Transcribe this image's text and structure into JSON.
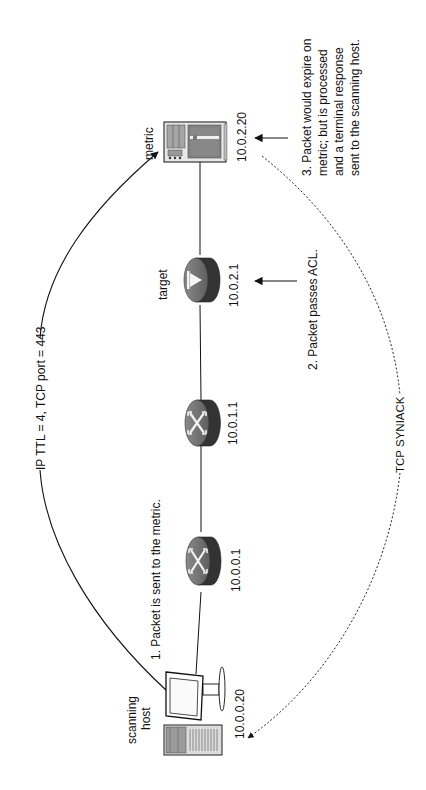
{
  "diagram": {
    "orientation": "rotated-90-ccw",
    "nodes": [
      {
        "id": "scanning-host",
        "label_line1": "scanning",
        "label_line2": "host",
        "ip": "10.0.0.20",
        "type": "workstation"
      },
      {
        "id": "router-1",
        "ip": "10.0.0.1",
        "type": "router"
      },
      {
        "id": "router-2",
        "ip": "10.0.1.1",
        "type": "router"
      },
      {
        "id": "target",
        "label": "target",
        "ip": "10.0.2.1",
        "type": "firewall-router"
      },
      {
        "id": "metric",
        "label": "metric",
        "ip": "10.0.2.20",
        "type": "server"
      }
    ],
    "flows": {
      "outbound": {
        "label": "IP TTL = 4, TCP port = 443",
        "style": "solid"
      },
      "return": {
        "label": "TCP SYNIACK",
        "style": "dashed"
      }
    },
    "annotations": {
      "step1": "1. Packet is sent to the metric.",
      "step2": "2. Packet  passes ACL.",
      "step3_line1": "3. Packet would expire on",
      "step3_line2": "metric; but is processed",
      "step3_line3": "and a terminal response",
      "step3_line4": "sent to the scanning host."
    },
    "colors": {
      "line": "#111111",
      "router_face": "#7a7a7a",
      "router_side": "#333333",
      "server_fill": "#dcdcdc",
      "background": "#ffffff"
    }
  }
}
